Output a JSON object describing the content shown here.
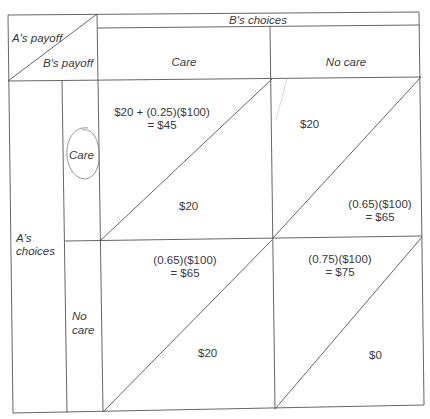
{
  "title_corner": {
    "row_label": "A's payoff",
    "col_label": "B's payoff"
  },
  "column_header": {
    "group_label": "B's choices",
    "columns": [
      "Care",
      "No care"
    ]
  },
  "row_header": {
    "group_label_line1": "A's",
    "group_label_line2": "choices",
    "rows": [
      {
        "label_line1": "Care",
        "label_line2": "",
        "circled": true
      },
      {
        "label_line1": "No",
        "label_line2": "care",
        "circled": false
      }
    ]
  },
  "cells": {
    "care_care": {
      "a_payoff_line1": "$20 + (0.25)($100)",
      "a_payoff_line2": "= $45",
      "b_payoff_line1": "$20",
      "b_payoff_line2": ""
    },
    "care_nocare": {
      "a_payoff_line1": "$20",
      "a_payoff_line2": "",
      "b_payoff_line1": "(0.65)($100)",
      "b_payoff_line2": "= $65"
    },
    "nocare_care": {
      "a_payoff_line1": "(0.65)($100)",
      "a_payoff_line2": "= $65",
      "b_payoff_line1": "$20",
      "b_payoff_line2": ""
    },
    "nocare_nocare": {
      "a_payoff_line1": "(0.75)($100)",
      "a_payoff_line2": "= $75",
      "b_payoff_line1": "$0",
      "b_payoff_line2": ""
    }
  },
  "colors": {
    "line": "#555555",
    "text": "#3a3a3a",
    "circle_annotation": "#8a8a8a"
  }
}
